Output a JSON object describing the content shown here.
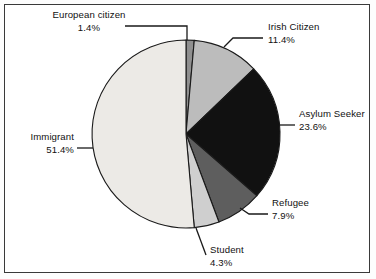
{
  "chart_data": {
    "type": "pie",
    "title": "",
    "subtitle": "",
    "xlabel": "",
    "ylabel": "",
    "legend_position": "none",
    "grid": false,
    "units": "percent",
    "categories": [
      "European citizen",
      "Irish Citizen",
      "Asylum Seeker",
      "Refugee",
      "Student",
      "Immigrant"
    ],
    "values": [
      1.4,
      11.4,
      23.6,
      7.9,
      4.3,
      51.4
    ],
    "labels": [
      "1.4%",
      "11.4%",
      "23.6%",
      "7.9%",
      "4.3%",
      "51.4%"
    ],
    "colors": [
      "#8f8f8f",
      "#bcbcbc",
      "#111111",
      "#5e5e5e",
      "#cfcfcf",
      "#eceae6"
    ],
    "slices": [
      {
        "name": "European citizen",
        "value": 1.4,
        "label": "1.4%",
        "color": "#8f8f8f",
        "start_angle": 0,
        "end_angle": 5.04
      },
      {
        "name": "Irish Citizen",
        "value": 11.4,
        "label": "11.4%",
        "color": "#bcbcbc",
        "start_angle": 5.04,
        "end_angle": 46.08
      },
      {
        "name": "Asylum Seeker",
        "value": 23.6,
        "label": "23.6%",
        "color": "#111111",
        "start_angle": 46.08,
        "end_angle": 131.04
      },
      {
        "name": "Refugee",
        "value": 7.9,
        "label": "7.9%",
        "color": "#5e5e5e",
        "start_angle": 131.04,
        "end_angle": 159.48
      },
      {
        "name": "Student",
        "value": 4.3,
        "label": "4.3%",
        "color": "#cfcfcf",
        "start_angle": 159.48,
        "end_angle": 174.96
      },
      {
        "name": "Immigrant",
        "value": 51.4,
        "label": "51.4%",
        "color": "#eceae6",
        "start_angle": 174.96,
        "end_angle": 360
      }
    ]
  },
  "geometry": {
    "center_x": 186,
    "center_y": 134,
    "radius": 94
  },
  "style": {
    "outline_color": "#1a1a1a",
    "frame_color": "#3a3a3a",
    "background": "#ffffff"
  }
}
